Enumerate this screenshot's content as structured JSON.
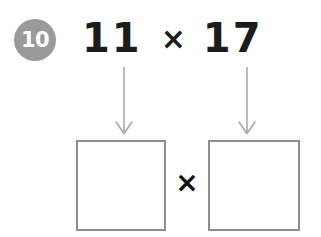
{
  "worksheet": {
    "question_number": "10",
    "badge_color": "#9a9a9a",
    "background_color": "#ffffff",
    "text_color": "#1c1c1c",
    "box_border_color": "#8e8e92",
    "arrow_color": "#a9a9ad"
  },
  "problem": {
    "first_factor": "11",
    "operator": "×",
    "second_factor": "17"
  },
  "arrows": {
    "left": "down-arrow-icon",
    "right": "down-arrow-icon"
  },
  "answer": {
    "left_box_value": "",
    "operator": "×",
    "right_box_value": ""
  }
}
